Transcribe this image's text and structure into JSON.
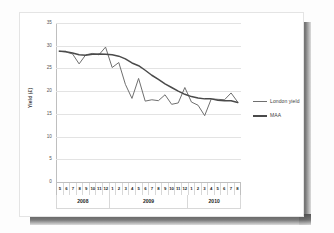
{
  "chart_data": {
    "type": "line",
    "title": "",
    "xlabel": "",
    "ylabel": "Yield (£)",
    "ylim": [
      0,
      35
    ],
    "yticks": [
      35,
      30,
      25,
      20,
      15,
      10,
      5,
      0
    ],
    "grid": true,
    "legend_position": "right",
    "legend": [
      "London yield",
      "MAA"
    ],
    "categories": [
      "5",
      "6",
      "7",
      "8",
      "9",
      "10",
      "11",
      "12",
      "1",
      "2",
      "3",
      "4",
      "5",
      "6",
      "7",
      "8",
      "9",
      "10",
      "11",
      "12",
      "1",
      "2",
      "3",
      "4",
      "5",
      "6",
      "7",
      "8"
    ],
    "group_labels": [
      "2008",
      "2009",
      "2010"
    ],
    "group_spans": [
      8,
      12,
      8
    ],
    "series": [
      {
        "name": "London yield",
        "color": "#6f6f6f",
        "values": [
          28.8,
          28.6,
          28.2,
          26.0,
          28.0,
          28.3,
          28.0,
          29.7,
          25.2,
          26.3,
          21.5,
          18.4,
          22.8,
          17.8,
          18.1,
          17.9,
          19.2,
          17.1,
          17.4,
          20.8,
          17.6,
          16.9,
          14.6,
          18.3,
          18.2,
          18.1,
          19.6,
          17.6
        ]
      },
      {
        "name": "MAA",
        "color": "#4a4a4a",
        "values": [
          28.8,
          28.7,
          28.4,
          28.0,
          27.9,
          28.1,
          28.2,
          28.1,
          28.0,
          27.7,
          27.1,
          26.2,
          25.6,
          24.6,
          23.5,
          22.6,
          21.6,
          20.8,
          20.0,
          19.3,
          18.8,
          18.5,
          18.3,
          18.3,
          18.0,
          17.9,
          17.9,
          17.5
        ]
      }
    ]
  },
  "figure": {
    "background": "#ffffff",
    "grid_color": "#e3e3e3",
    "axis_color": "#bfbfbf"
  }
}
